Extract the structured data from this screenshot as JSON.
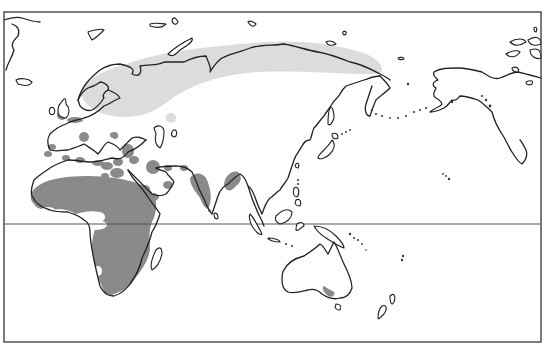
{
  "map": {
    "type": "species-range-map",
    "projection_extent": "Europe, Africa, Asia, Australia, North Pacific, Alaska",
    "legend_visible": false,
    "text_labels": [],
    "colors": {
      "background": "#ffffff",
      "coastline": "#222222",
      "frame": "#444444",
      "equator": "#555555",
      "breeding_range": "#dcdcdc",
      "wintering_range": "#8a8a8a"
    },
    "reference_lines": [
      {
        "name": "equator",
        "y": 224
      }
    ],
    "ranges": [
      {
        "name": "breeding-range",
        "shade": "light gray",
        "region": "northern Eurasia from Scandinavia/Baltic to eastern Siberia"
      },
      {
        "name": "wintering-range-africa",
        "shade": "dark gray",
        "region": "Sub-Saharan Africa (Sahel to South Africa)"
      },
      {
        "name": "wintering-range-mediterranean",
        "shade": "dark gray",
        "region": "Mediterranean coasts, British Isles, Low Countries"
      },
      {
        "name": "wintering-range-middle-east",
        "shade": "dark gray",
        "region": "Arabian Peninsula, Persian Gulf, Caspian region"
      },
      {
        "name": "wintering-range-india",
        "shade": "dark gray",
        "region": "Indian subcontinent"
      },
      {
        "name": "wintering-range-southeast-asia",
        "shade": "dark gray",
        "region": "Bangladesh/Myanmar"
      },
      {
        "name": "wintering-range-australia",
        "shade": "dark gray",
        "region": "South-east Australia (Victoria coast)"
      }
    ]
  }
}
